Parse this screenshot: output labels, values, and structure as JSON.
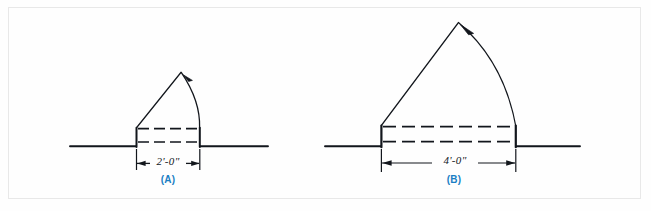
{
  "plate": {
    "background_color": "#fefefe",
    "frame_color": "#9c9c9c",
    "ink_color": "#12161c",
    "caption_color": "#1a7fc4"
  },
  "figures": [
    {
      "id": "figure-a",
      "caption": "(A)",
      "dimension_label": "2'-0\"",
      "door_width_feet": 2,
      "door_width_inches": 0,
      "hinge_side": "left",
      "swing_direction": "counterclockwise",
      "ground_line_y": 146,
      "opening_left_x": 136,
      "opening_right_x": 200,
      "jamb_top_y": 128,
      "leaf_apex_x": 181,
      "leaf_apex_y": 72
    },
    {
      "id": "figure-b",
      "caption": "(B)",
      "dimension_label": "4'-0\"",
      "door_width_feet": 4,
      "door_width_inches": 0,
      "hinge_side": "left",
      "swing_direction": "counterclockwise",
      "ground_line_y": 146,
      "opening_left_x": 381,
      "opening_right_x": 516,
      "jamb_top_y": 126,
      "leaf_apex_x": 458,
      "leaf_apex_y": 22
    }
  ],
  "annotations": {
    "arc_arrowhead": "arrowhead-icon",
    "dimension_arrow_left": "dimension-arrow-left-icon",
    "dimension_arrow_right": "dimension-arrow-right-icon"
  }
}
